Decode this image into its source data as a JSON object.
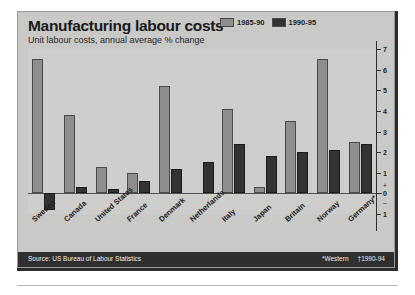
{
  "header": {
    "title": "Manufacturing labour costs",
    "subtitle": "Unit labour costs, annual average % change"
  },
  "footer": {
    "source": "Source: US Bureau of Labour Statistics",
    "note_western": "*Western",
    "note_years": "†1990-94"
  },
  "axis": {
    "ticks": [
      "7",
      "6",
      "5",
      "4",
      "3",
      "2",
      "1",
      "0",
      "1"
    ],
    "plus_sign": "+",
    "minus_sign": "–"
  },
  "chart_data": {
    "type": "bar",
    "title": "Manufacturing labour costs",
    "subtitle": "Unit labour costs, annual average % change",
    "xlabel": "",
    "ylabel": "",
    "ylim": [
      -1,
      7
    ],
    "grid": false,
    "legend_position": "top-right",
    "categories": [
      "Sweden",
      "Canada",
      "United States",
      "France",
      "Denmark",
      "Netherlands",
      "Italy",
      "Japan",
      "Britain",
      "Norway",
      "Germany*"
    ],
    "series": [
      {
        "name": "1985-90",
        "color": "#8d8d8b",
        "values": [
          6.5,
          3.8,
          1.3,
          1.0,
          5.2,
          0.0,
          4.1,
          0.3,
          3.5,
          6.5,
          2.5
        ]
      },
      {
        "name": "1990-95",
        "color": "#333333",
        "values": [
          -0.8,
          0.3,
          0.2,
          0.6,
          1.2,
          1.5,
          2.4,
          1.8,
          2.0,
          2.1,
          2.4
        ]
      }
    ],
    "annotations": [
      "*Western",
      "†1990-94"
    ],
    "source": "Source: US Bureau of Labour Statistics"
  }
}
